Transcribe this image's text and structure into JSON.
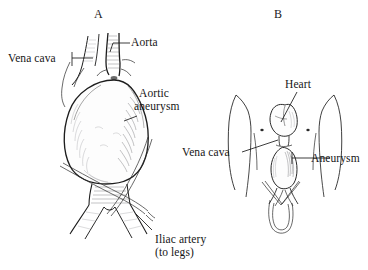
{
  "figure": {
    "background_color": "#ffffff",
    "ink_color": "#1d1d1d",
    "panels": [
      {
        "id": "A",
        "letter": "A",
        "caption": "Close-up view of abdominal aorta with aneurysm",
        "labels": [
          {
            "name": "vena-cava",
            "text": "Vena cava",
            "lines": [
              "Vena cava"
            ]
          },
          {
            "name": "aorta",
            "text": "Aorta",
            "lines": [
              "Aorta"
            ]
          },
          {
            "name": "aortic-aneurysm",
            "text": "Aortic aneurysm",
            "lines": [
              "Aortic",
              "aneurysm"
            ]
          },
          {
            "name": "iliac-artery",
            "text": "Iliac artery (to legs)",
            "lines": [
              "Iliac artery",
              "(to legs)"
            ]
          }
        ]
      },
      {
        "id": "B",
        "letter": "B",
        "caption": "Whole-body view showing location of aneurysm in torso",
        "labels": [
          {
            "name": "heart",
            "text": "Heart",
            "lines": [
              "Heart"
            ]
          },
          {
            "name": "vena-cava",
            "text": "Vena cava",
            "lines": [
              "Vena cava"
            ]
          },
          {
            "name": "aneurysm",
            "text": "Aneurysm",
            "lines": [
              "Aneurysm"
            ]
          }
        ]
      }
    ]
  },
  "panel_a": {
    "letter": "A",
    "label_vena_cava": "Vena cava",
    "label_aorta": "Aorta",
    "label_aortic_l1": "Aortic",
    "label_aortic_l2": "aneurysm",
    "label_iliac_l1": "Iliac artery",
    "label_iliac_l2": "(to legs)"
  },
  "panel_b": {
    "letter": "B",
    "label_heart": "Heart",
    "label_vena_cava": "Vena cava",
    "label_aneurysm": "Aneurysm"
  }
}
